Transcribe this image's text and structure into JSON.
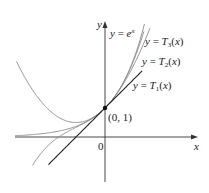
{
  "figure": {
    "axes": {
      "x_label": "x",
      "y_label": "y",
      "origin_label": "0"
    },
    "point": {
      "label": "(0, 1)",
      "x": 0,
      "y": 1
    },
    "curves": [
      {
        "id": "exp",
        "label_prefix": "y = ",
        "label_main": "e",
        "label_sup": "x",
        "formula": "e^x",
        "color": "#8a8a8a"
      },
      {
        "id": "T3",
        "label_prefix": "y = ",
        "label_main": "T",
        "label_sub": "3",
        "label_suffix": "(x)",
        "formula": "1 + x + x^2/2 + x^3/6",
        "color": "#8a8a8a"
      },
      {
        "id": "T2",
        "label_prefix": "y = ",
        "label_main": "T",
        "label_sub": "2",
        "label_suffix": "(x)",
        "formula": "1 + x + x^2/2",
        "color": "#8a8a8a"
      },
      {
        "id": "T1",
        "label_prefix": "y = ",
        "label_main": "T",
        "label_sub": "1",
        "label_suffix": "(x)",
        "formula": "1 + x",
        "color": "#222222"
      }
    ],
    "colors": {
      "axis": "#333333",
      "curve": "#8a8a8a",
      "tangent_line": "#222222",
      "text": "#222222"
    }
  }
}
